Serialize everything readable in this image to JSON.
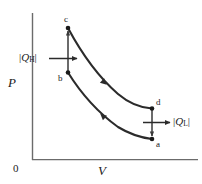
{
  "figure": {
    "background_color": "#ffffff",
    "stroke_color": "#2b2b2b",
    "axis_color": "#555555",
    "axes": {
      "y_label": "P",
      "x_label": "V",
      "origin_label": "0"
    },
    "points": [
      {
        "name": "a",
        "label": "a",
        "x": 152,
        "y": 139
      },
      {
        "name": "b",
        "label": "b",
        "x": 68,
        "y": 72
      },
      {
        "name": "c",
        "label": "c",
        "x": 68,
        "y": 28
      },
      {
        "name": "d",
        "label": "d",
        "x": 152,
        "y": 108
      }
    ],
    "heat_labels": {
      "hot": {
        "symbol": "Q",
        "subscript": "H",
        "text": "|Q_H|",
        "direction": "into-system"
      },
      "cold": {
        "symbol": "Q",
        "subscript": "L",
        "text": "|Q_L|",
        "direction": "out-of-system"
      }
    },
    "processes": [
      {
        "from": "b",
        "to": "c",
        "type": "isochoric-vertical",
        "arrow": "up"
      },
      {
        "from": "c",
        "to": "d",
        "type": "adiabatic-expansion",
        "arrow": "right-down"
      },
      {
        "from": "d",
        "to": "a",
        "type": "isochoric-vertical",
        "arrow": "down"
      },
      {
        "from": "a",
        "to": "b",
        "type": "adiabatic-compression",
        "arrow": "left-up"
      }
    ]
  }
}
